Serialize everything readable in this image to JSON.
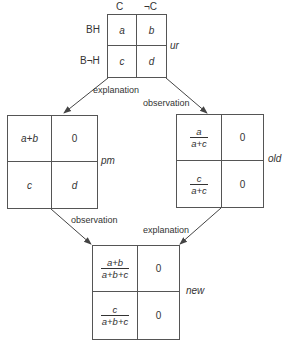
{
  "diagram": {
    "type": "flow-of-2x2-tables",
    "colors": {
      "line": "#444444",
      "text": "#333333",
      "background": "#ffffff"
    },
    "top_table": {
      "name": "ur",
      "col_headers": [
        "C",
        "¬C"
      ],
      "row_headers": [
        "BH",
        "B¬H"
      ],
      "cells": [
        [
          "a",
          "b"
        ],
        [
          "c",
          "d"
        ]
      ]
    },
    "left_table": {
      "name": "pm",
      "cells": [
        [
          "a+b",
          "0"
        ],
        [
          "c",
          "d"
        ]
      ]
    },
    "right_table": {
      "name": "old",
      "cells": [
        [
          {
            "num": "a",
            "den": "a+c"
          },
          "0"
        ],
        [
          {
            "num": "c",
            "den": "a+c"
          },
          "0"
        ]
      ]
    },
    "bottom_table": {
      "name": "new",
      "cells": [
        [
          {
            "num": "a+b",
            "den": "a+b+c"
          },
          "0"
        ],
        [
          {
            "num": "c",
            "den": "a+b+c"
          },
          "0"
        ]
      ]
    },
    "edges": [
      {
        "from": "ur",
        "to": "pm",
        "label": "explanation"
      },
      {
        "from": "ur",
        "to": "old",
        "label": "observation"
      },
      {
        "from": "pm",
        "to": "new",
        "label": "observation"
      },
      {
        "from": "old",
        "to": "new",
        "label": "explanation"
      }
    ]
  }
}
